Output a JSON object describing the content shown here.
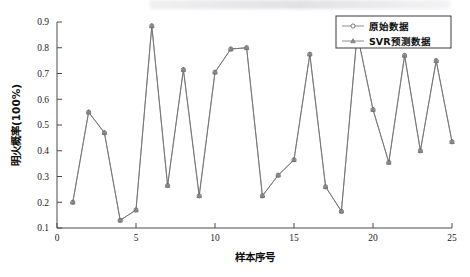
{
  "figure": {
    "background": "#ffffff",
    "line_color": "#6f6f6f",
    "axis_color": "#4a4a4a"
  },
  "legend": {
    "position": "top-right",
    "entries": [
      {
        "label": "原始数据",
        "marker": "circle-marker-icon"
      },
      {
        "label": "SVR预测数据",
        "marker": "triangle-marker-icon"
      }
    ]
  },
  "chart_data": {
    "type": "line",
    "title": "",
    "xlabel": "样本序号",
    "ylabel": "明火概率(100%)",
    "xlim": [
      0,
      25
    ],
    "ylim": [
      0.1,
      0.9
    ],
    "xticks": [
      0,
      5,
      10,
      15,
      20,
      25
    ],
    "yticks": [
      0.1,
      0.2,
      0.3,
      0.4,
      0.5,
      0.6,
      0.7,
      0.8,
      0.9
    ],
    "xtick_labels": [
      "0",
      "5",
      "10",
      "15",
      "20",
      "25"
    ],
    "ytick_labels": [
      "0.1",
      "0.2",
      "0.3",
      "0.4",
      "0.5",
      "0.6",
      "0.7",
      "0.8",
      "0.9"
    ],
    "grid": false,
    "legend_position": "upper right",
    "x": [
      1,
      2,
      3,
      4,
      5,
      6,
      7,
      8,
      9,
      10,
      11,
      12,
      13,
      14,
      15,
      16,
      17,
      18,
      19,
      20,
      21,
      22,
      23,
      24,
      25
    ],
    "series": [
      {
        "name": "原始数据",
        "marker": "circle",
        "values": [
          0.2,
          0.55,
          0.47,
          0.13,
          0.17,
          0.885,
          0.265,
          0.715,
          0.225,
          0.705,
          0.795,
          0.8,
          0.225,
          0.305,
          0.365,
          0.775,
          0.26,
          0.165,
          0.855,
          0.56,
          0.355,
          0.77,
          0.4,
          0.75,
          0.435
        ]
      },
      {
        "name": "SVR预测数据",
        "marker": "triangle",
        "values": [
          0.2,
          0.55,
          0.47,
          0.13,
          0.17,
          0.885,
          0.265,
          0.715,
          0.225,
          0.705,
          0.795,
          0.8,
          0.225,
          0.305,
          0.365,
          0.775,
          0.26,
          0.165,
          0.855,
          0.56,
          0.355,
          0.77,
          0.4,
          0.75,
          0.435
        ]
      }
    ]
  }
}
